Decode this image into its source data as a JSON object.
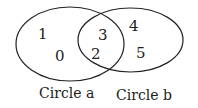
{
  "diagram": {
    "type": "venn",
    "circles": [
      {
        "label": "Circle a",
        "only_elements": [
          "1",
          "0"
        ]
      },
      {
        "label": "Circle b",
        "only_elements": [
          "4",
          "5"
        ]
      }
    ],
    "intersection": [
      "3",
      "2"
    ],
    "stroke_color": "#222222",
    "background": "#ffffff"
  },
  "labels": {
    "a": "Circle a",
    "b": "Circle b"
  },
  "elements": {
    "a_only_1": "1",
    "a_only_2": "0",
    "both_1": "3",
    "both_2": "2",
    "b_only_1": "4",
    "b_only_2": "5"
  }
}
